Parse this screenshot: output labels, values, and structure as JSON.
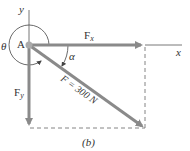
{
  "diagram": {
    "axes": {
      "x_label": "x",
      "y_label": "y"
    },
    "origin_label": "A",
    "angles": {
      "theta": "θ",
      "alpha": "α"
    },
    "forces": {
      "fx": {
        "label": "F",
        "sub": "x"
      },
      "fy": {
        "label": "F",
        "sub": "y"
      },
      "f": {
        "label": "F = 300 N"
      }
    },
    "caption": "(b)",
    "colors": {
      "arrow": "#8a8a8a",
      "line": "#555555",
      "dash": "#666666"
    }
  }
}
